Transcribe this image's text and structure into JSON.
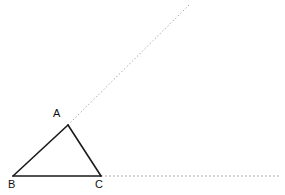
{
  "figure": {
    "background_color": "#ffffff",
    "width": 285,
    "height": 195,
    "labels": {
      "a": "A",
      "b": "B",
      "c": "C"
    },
    "colors": {
      "solid_stroke": "#1a1a1a",
      "dotted_stroke": "#9a9a9a",
      "label_text": "#111111"
    },
    "points": {
      "A": {
        "x": 68,
        "y": 125
      },
      "B": {
        "x": 13,
        "y": 176
      },
      "C": {
        "x": 101,
        "y": 176
      },
      "ray_end": {
        "x": 190,
        "y": 4
      },
      "base_line_end": {
        "x": 281,
        "y": 176
      }
    },
    "segments": [
      {
        "name": "side-AB",
        "from": "B",
        "to": "A",
        "style": "solid",
        "width": 1.6
      },
      {
        "name": "side-AC",
        "from": "A",
        "to": "C",
        "style": "solid",
        "width": 1.6
      },
      {
        "name": "side-BC",
        "from": "B",
        "to": "C",
        "style": "solid",
        "width": 1.6
      }
    ],
    "dotted_lines": [
      {
        "name": "ray-BA-extended",
        "from": "A",
        "to": "ray_end",
        "style": "dotted",
        "width": 1
      },
      {
        "name": "base-BC-extended",
        "from": "C",
        "to": "base_line_end",
        "style": "dotted",
        "width": 1
      }
    ],
    "geometry": {
      "ray_slope_description": "ray from A continues line BA upward to the right at about 45 degrees",
      "base_line_description": "horizontal dotted line continues from C to the right edge"
    }
  }
}
